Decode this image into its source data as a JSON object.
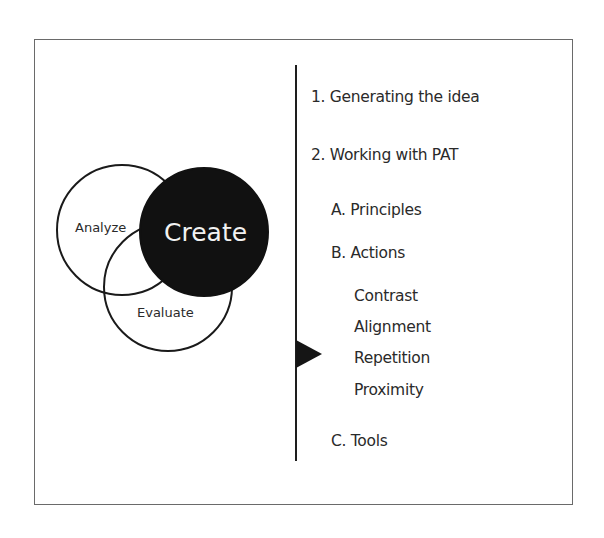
{
  "diagram": {
    "venn": {
      "circles": [
        {
          "id": "analyze",
          "label": "Analyze",
          "cx": 122,
          "cy": 230,
          "r": 65,
          "fill": "none",
          "stroke": "#1a1a1a"
        },
        {
          "id": "evaluate",
          "label": "Evaluate",
          "cx": 168,
          "cy": 287,
          "r": 64,
          "fill": "none",
          "stroke": "#1a1a1a"
        },
        {
          "id": "create",
          "label": "Create",
          "cx": 204,
          "cy": 232,
          "r": 64,
          "fill": "#111111",
          "stroke": "#111111"
        }
      ],
      "labels": {
        "analyze": "Analyze",
        "create": "Create",
        "evaluate": "Evaluate"
      }
    },
    "outline": {
      "items": [
        {
          "level": 1,
          "label": "1. Generating the idea"
        },
        {
          "level": 1,
          "label": "2. Working with PAT"
        },
        {
          "level": 2,
          "label": "A. Principles"
        },
        {
          "level": 2,
          "label": "B. Actions"
        },
        {
          "level": 3,
          "label": "Contrast"
        },
        {
          "level": 3,
          "label": "Alignment"
        },
        {
          "level": 3,
          "label": "Repetition"
        },
        {
          "level": 3,
          "label": "Proximity"
        },
        {
          "level": 2,
          "label": "C. Tools"
        }
      ],
      "current_marker": "Repetition"
    },
    "colors": {
      "border": "#6a6a6a",
      "ink": "#111111",
      "text": "#2a2a2a",
      "background": "#ffffff"
    }
  }
}
